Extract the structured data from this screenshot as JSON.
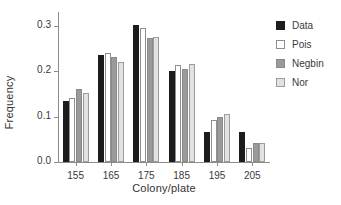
{
  "chart_data": {
    "type": "bar",
    "title": "",
    "xlabel": "Colony/plate",
    "ylabel": "Frequency",
    "categories": [
      "155",
      "165",
      "175",
      "185",
      "195",
      "205"
    ],
    "series": [
      {
        "name": "Data",
        "color": "#1c1c1c",
        "values": [
          0.135,
          0.235,
          0.301,
          0.2,
          0.067,
          0.067
        ]
      },
      {
        "name": "Pois",
        "color": "#ffffff",
        "values": [
          0.14,
          0.239,
          0.295,
          0.213,
          0.092,
          0.031
        ]
      },
      {
        "name": "Negbin",
        "color": "#9a9a9a",
        "values": [
          0.16,
          0.23,
          0.273,
          0.205,
          0.099,
          0.041
        ]
      },
      {
        "name": "Nor",
        "color": "#e2e2e2",
        "values": [
          0.152,
          0.221,
          0.274,
          0.216,
          0.106,
          0.041
        ]
      }
    ],
    "ylim": [
      0.0,
      0.33
    ],
    "yticks": [
      0.0,
      0.1,
      0.2,
      0.3
    ],
    "ytick_labels": [
      "0.0",
      "0.1",
      "0.2",
      "0.3"
    ],
    "grid": false,
    "legend_position": "right"
  },
  "legend": {
    "entries": [
      "Data",
      "Pois",
      "Negbin",
      "Nor"
    ]
  }
}
